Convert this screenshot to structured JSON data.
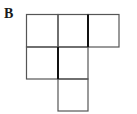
{
  "figure": {
    "label": "B",
    "line_color": "#4a4a4a",
    "thick_line_color": "#1a1a1a"
  }
}
